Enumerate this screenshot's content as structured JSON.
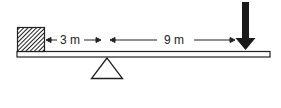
{
  "diagram": {
    "type": "lever-seesaw",
    "elements": {
      "mass_block": {
        "fill": "hatched",
        "position": "left-end"
      },
      "beam": {
        "orientation": "horizontal"
      },
      "fulcrum": {
        "shape": "triangle"
      },
      "force_arrow": {
        "direction": "down",
        "position": "right-end"
      }
    },
    "dimensions": [
      {
        "label": "3 m",
        "from": "block",
        "to": "fulcrum"
      },
      {
        "label": "9 m",
        "from": "fulcrum",
        "to": "force"
      }
    ],
    "colors": {
      "ink": "#222222",
      "background": "#ffffff"
    }
  }
}
